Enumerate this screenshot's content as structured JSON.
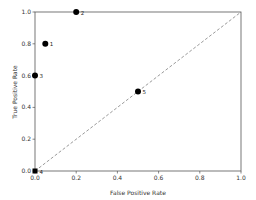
{
  "chart_data": {
    "type": "scatter",
    "title": "",
    "xlabel": "False Positive Rate",
    "ylabel": "True Positive Rate",
    "xlim": [
      0.0,
      1.0
    ],
    "ylim": [
      0.0,
      1.0
    ],
    "grid": false,
    "legend": null,
    "x_ticks": [
      "0.0",
      "0.2",
      "0.4",
      "0.6",
      "0.8",
      "1.0"
    ],
    "y_ticks": [
      "0.0",
      "0.2",
      "0.4",
      "0.6",
      "0.8",
      "1.0"
    ],
    "points": [
      {
        "label": "1",
        "x": 0.05,
        "y": 0.8,
        "marker": "circle"
      },
      {
        "label": "2",
        "x": 0.2,
        "y": 1.0,
        "marker": "circle"
      },
      {
        "label": "3",
        "x": 0.0,
        "y": 0.6,
        "marker": "circle"
      },
      {
        "label": "4",
        "x": 0.0,
        "y": 0.0,
        "marker": "square"
      },
      {
        "label": "5",
        "x": 0.5,
        "y": 0.5,
        "marker": "circle"
      }
    ],
    "reference_line": {
      "from": [
        0,
        0
      ],
      "to": [
        1,
        1
      ],
      "style": "dashed",
      "color": "#808080"
    },
    "marker_color": "#000000",
    "axis_color": "#555555"
  }
}
